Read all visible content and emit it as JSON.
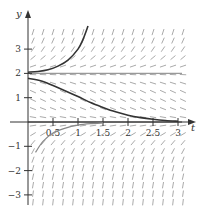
{
  "figure": {
    "title": "",
    "type": "slope-field",
    "x_axis_label": "t",
    "y_axis_label": "y",
    "x_ticks": [
      "0.5",
      "1",
      "1.5",
      "2",
      "2.5",
      "3"
    ],
    "x_tick_values": [
      0.5,
      1,
      1.5,
      2,
      2.5,
      3
    ],
    "y_ticks": [
      "3",
      "2",
      "1",
      "−1",
      "−2",
      "−3"
    ],
    "y_tick_values": [
      3,
      2,
      1,
      -1,
      -2,
      -3
    ],
    "equilibrium_lines": [
      0,
      2
    ],
    "colors": {
      "axis": "#333333",
      "field": "#aaaaaa",
      "solution": "#333333",
      "equilibrium": "#999999"
    }
  },
  "chart_data": {
    "type": "slope-field",
    "title": "",
    "xlabel": "t",
    "ylabel": "y",
    "xlim": [
      0,
      3.2
    ],
    "ylim": [
      -3.4,
      4.3
    ],
    "slope_function": "dy/dt = y(y - 2)",
    "field_grid": {
      "t_start": 0.1,
      "t_step": 0.2,
      "t_end": 3.1,
      "y_start": -3.3,
      "y_step": 0.35,
      "y_end": 4.0
    },
    "equilibria": [
      0,
      2
    ],
    "solutions": [
      {
        "name": "upper",
        "points": [
          [
            0,
            2.05
          ],
          [
            0.2,
            2.08
          ],
          [
            0.4,
            2.15
          ],
          [
            0.6,
            2.3
          ],
          [
            0.8,
            2.55
          ],
          [
            1.0,
            3.0
          ],
          [
            1.1,
            3.4
          ],
          [
            1.2,
            3.95
          ]
        ]
      },
      {
        "name": "middle",
        "points": [
          [
            0,
            1.8
          ],
          [
            0.25,
            1.7
          ],
          [
            0.5,
            1.5
          ],
          [
            0.75,
            1.28
          ],
          [
            1.0,
            1.05
          ],
          [
            1.25,
            0.8
          ],
          [
            1.5,
            0.6
          ],
          [
            1.75,
            0.42
          ],
          [
            2.0,
            0.28
          ],
          [
            2.25,
            0.18
          ],
          [
            2.5,
            0.11
          ],
          [
            2.75,
            0.06
          ],
          [
            3.0,
            0.03
          ]
        ]
      },
      {
        "name": "lower",
        "points": [
          [
            0.15,
            -1.25
          ],
          [
            0.3,
            -0.8
          ],
          [
            0.5,
            -0.45
          ],
          [
            0.75,
            -0.25
          ],
          [
            1.0,
            -0.13
          ],
          [
            1.25,
            -0.07
          ],
          [
            1.5,
            -0.04
          ]
        ]
      }
    ]
  }
}
